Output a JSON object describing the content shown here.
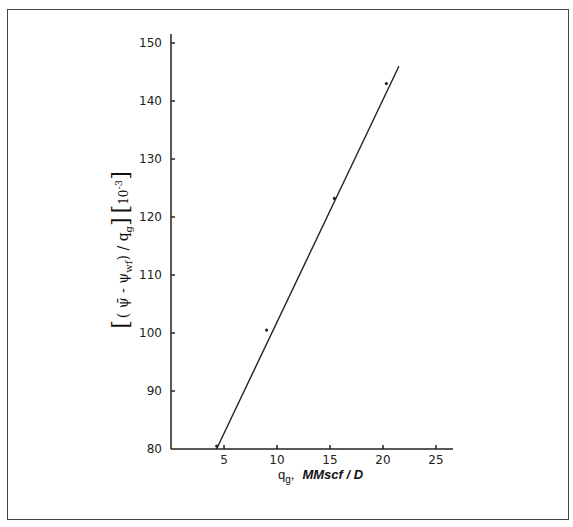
{
  "chart_data": {
    "type": "scatter",
    "title": "",
    "xlabel": "q_g, MMscf / D",
    "xlabel_parts": {
      "symbol": "q",
      "subscript": "g",
      "comma": ",",
      "unit": "MMscf / D"
    },
    "ylabel": "[ (ψ̄ − ψ_wf) / q_g ] [10^-3]",
    "ylabel_parts": {
      "main": "( ψ̄  -  ψ",
      "sub": "wf",
      "tail": ") / q",
      "sub2": "g",
      "scale": "10",
      "exp": "-3"
    },
    "xlim": [
      0,
      27
    ],
    "ylim": [
      80,
      152
    ],
    "x_ticks": [
      5,
      10,
      15,
      20,
      25
    ],
    "y_ticks": [
      80,
      90,
      100,
      110,
      120,
      130,
      140,
      150
    ],
    "grid": false,
    "legend": null,
    "series": [
      {
        "name": "measured",
        "kind": "points",
        "x": [
          4.6,
          9.3,
          15.7,
          20.6
        ],
        "y": [
          80.5,
          100.5,
          123.2,
          143.0
        ]
      },
      {
        "name": "fitted straight line",
        "kind": "line",
        "x": [
          4.3,
          21.5
        ],
        "y": [
          80.0,
          146.0
        ]
      }
    ]
  }
}
